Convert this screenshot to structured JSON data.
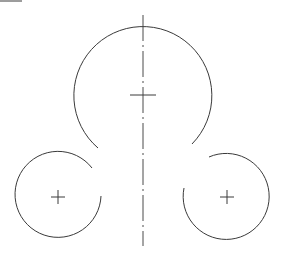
{
  "drawing": {
    "type": "technical-line-drawing",
    "background": "#ffffff",
    "stroke_color": "#3a3a3a",
    "corner_mark": {
      "x1": 0,
      "y1": 1,
      "x2": 22,
      "y2": 1
    },
    "center_line": {
      "x": 143,
      "y1": 15,
      "y2": 246
    },
    "large_arc": {
      "cx": 143,
      "cy": 95,
      "r": 69,
      "start": {
        "x": 98,
        "y": 148
      },
      "end": {
        "x": 192,
        "y": 144
      },
      "center_mark": {
        "x1": 130,
        "x2": 156,
        "y": 95
      }
    },
    "left_arc": {
      "cx": 58,
      "cy": 197,
      "r": 43,
      "start": {
        "x": 92,
        "y": 168
      },
      "end": {
        "x": 101,
        "y": 196
      },
      "center_mark_size": 7
    },
    "right_arc": {
      "cx": 227,
      "cy": 197,
      "r": 43,
      "start": {
        "x": 209,
        "y": 157
      },
      "end": {
        "x": 184,
        "y": 188
      },
      "center_mark_size": 7
    }
  }
}
